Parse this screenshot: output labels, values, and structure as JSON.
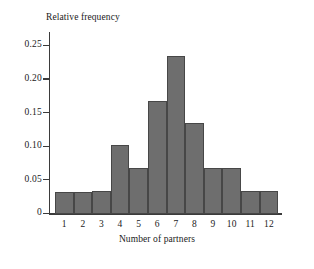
{
  "chart_data": {
    "type": "bar",
    "title": "",
    "xlabel": "Number of partners",
    "ylabel": "Relative frequency",
    "categories": [
      "1",
      "2",
      "3",
      "4",
      "5",
      "6",
      "7",
      "8",
      "9",
      "10",
      "11",
      "12"
    ],
    "values": [
      0.033,
      0.033,
      0.034,
      0.102,
      0.068,
      0.168,
      0.235,
      0.135,
      0.068,
      0.068,
      0.035,
      0.035
    ],
    "ylim": [
      0,
      0.27
    ],
    "y_ticks": [
      0,
      0.05,
      0.1,
      0.15,
      0.2,
      0.25
    ],
    "y_tick_labels": [
      "0",
      "0.05",
      "0.10",
      "0.15",
      "0.20",
      "0.25"
    ],
    "grid": false,
    "legend": false,
    "bar_fill_color": "#6e6e6e",
    "bar_edge_color": "#474747",
    "axis_color": "#3b3b3b",
    "background_color": "#ffffff"
  }
}
